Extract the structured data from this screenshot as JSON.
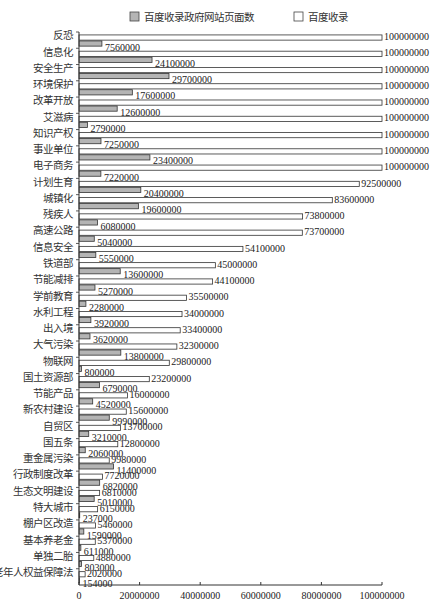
{
  "chart_data": {
    "type": "bar",
    "orientation": "horizontal",
    "title": "",
    "xlabel": "",
    "ylabel": "",
    "xlim": [
      0,
      100000000
    ],
    "xticks": [
      0,
      20000000,
      40000000,
      60000000,
      80000000,
      100000000
    ],
    "xtick_labels": [
      "0",
      "20000000",
      "40000000",
      "60000000",
      "80000000",
      "100000000"
    ],
    "grid": false,
    "legend_position": "top",
    "categories": [
      "反恐",
      "信息化",
      "安全生产",
      "环境保护",
      "改革开放",
      "艾滋病",
      "知识产权",
      "事业单位",
      "电子商务",
      "计划生育",
      "城镇化",
      "残疾人",
      "高速公路",
      "信息安全",
      "铁道部",
      "节能减排",
      "学前教育",
      "水利工程",
      "出入境",
      "大气污染",
      "物联网",
      "国土资源部",
      "节能产品",
      "新农村建设",
      "自贸区",
      "国五条",
      "重金属污染",
      "行政制度改革",
      "生态文明建设",
      "特大城市",
      "棚户区改造",
      "基本养老金",
      "单独二胎",
      "老年人权益保障法"
    ],
    "series": [
      {
        "name": "百度收录",
        "color": "#ffffff",
        "values": [
          100000000,
          100000000,
          100000000,
          100000000,
          100000000,
          100000000,
          100000000,
          100000000,
          100000000,
          92500000,
          83600000,
          73800000,
          73700000,
          54100000,
          45000000,
          44100000,
          35500000,
          34000000,
          33400000,
          32300000,
          29800000,
          23200000,
          16000000,
          15600000,
          13700000,
          12800000,
          9980000,
          7720000,
          6810000,
          6150000,
          5460000,
          5370000,
          4880000,
          2020000
        ]
      },
      {
        "name": "百度收录政府网站页面数",
        "color": "#b4b4b4",
        "values": [
          7560000,
          24100000,
          29700000,
          17600000,
          12600000,
          2790000,
          7250000,
          23400000,
          7220000,
          20400000,
          19600000,
          6080000,
          5040000,
          5550000,
          13600000,
          5270000,
          2280000,
          3920000,
          3620000,
          13800000,
          800000,
          6790000,
          4520000,
          9990000,
          3210000,
          2060000,
          11400000,
          6820000,
          5010000,
          237000,
          1590000,
          611000,
          803000,
          154000
        ]
      }
    ]
  },
  "legend": [
    {
      "label": "百度收录政府网站页面数",
      "color": "#b4b4b4"
    },
    {
      "label": "百度收录",
      "color": "#ffffff"
    }
  ]
}
